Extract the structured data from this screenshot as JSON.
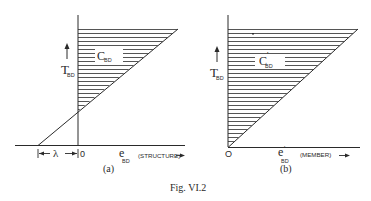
{
  "figure": {
    "caption": "Fig. VI.2",
    "ink_color": "#2a2a2a",
    "background": "#ffffff"
  },
  "panel_a": {
    "label": "(a)",
    "y_axis_symbol": "T",
    "y_axis_sub": "BD",
    "x_axis_symbol": "e",
    "x_axis_sub": "BD",
    "x_axis_note": "(STRUCTURE)",
    "region_symbol": "C",
    "region_sub": "BD",
    "origin": "0",
    "offset_symbol": "λ"
  },
  "panel_b": {
    "label": "(b)",
    "y_axis_symbol": "T",
    "y_axis_sub": "BD",
    "x_axis_symbol": "e",
    "x_axis_prime": "'",
    "x_axis_sub": "BD",
    "x_axis_note": "(MEMBER)",
    "region_symbol": "C",
    "region_prime": "'",
    "region_sub": "BD",
    "origin": "O"
  }
}
